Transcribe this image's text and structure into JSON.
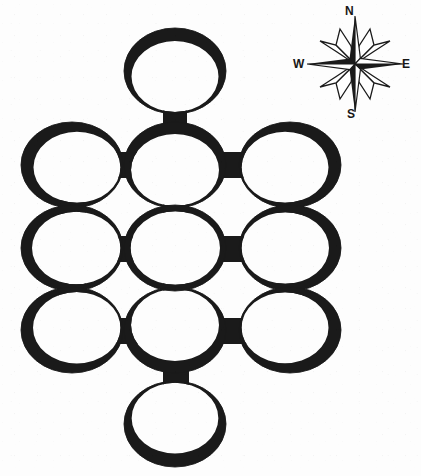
{
  "figure": {
    "kind": "map-diagram",
    "background_color": "#fdfdfd",
    "ink_color": "#1a1a1a",
    "canvas": {
      "width": 421,
      "height": 476
    }
  },
  "compass": {
    "name": "compass-rose",
    "center": {
      "x": 65,
      "y": 62
    },
    "labels": {
      "north": "N",
      "east": "E",
      "south": "S",
      "west": "W"
    },
    "points": 8,
    "style": "eight-point-star-black-and-white"
  },
  "network": {
    "ring_count": 11,
    "connector_count": 12,
    "ring_rx": 51,
    "ring_ry": 43,
    "rings": [
      {
        "id": "ring-top",
        "name": "ring-north-stem",
        "cx": 175,
        "cy": 71,
        "thick_angle_deg": 270,
        "thin": 2.0,
        "thick": 13.0
      },
      {
        "id": "ring-r1c1",
        "name": "ring-row1-col1",
        "cx": 72,
        "cy": 165,
        "thick_angle_deg": 205,
        "thin": 2.0,
        "thick": 13.0
      },
      {
        "id": "ring-r1c2",
        "name": "ring-row1-col2",
        "cx": 175,
        "cy": 165,
        "thick_angle_deg": 270,
        "thin": 2.0,
        "thick": 12.0
      },
      {
        "id": "ring-r1c3",
        "name": "ring-row1-col3",
        "cx": 290,
        "cy": 165,
        "thick_angle_deg": 335,
        "thin": 2.0,
        "thick": 13.0
      },
      {
        "id": "ring-r2c1",
        "name": "ring-row2-col1",
        "cx": 72,
        "cy": 248,
        "thick_angle_deg": 180,
        "thin": 2.5,
        "thick": 11.0
      },
      {
        "id": "ring-r2c2",
        "name": "ring-row2-col2-center",
        "cx": 175,
        "cy": 248,
        "thick_angle_deg": 180,
        "thin": 6.0,
        "thick": 6.5
      },
      {
        "id": "ring-r2c3",
        "name": "ring-row2-col3",
        "cx": 290,
        "cy": 248,
        "thick_angle_deg": 0,
        "thin": 2.5,
        "thick": 12.0
      },
      {
        "id": "ring-r3c1",
        "name": "ring-row3-col1",
        "cx": 72,
        "cy": 330,
        "thick_angle_deg": 155,
        "thin": 2.0,
        "thick": 12.5
      },
      {
        "id": "ring-r3c2",
        "name": "ring-row3-col2",
        "cx": 175,
        "cy": 330,
        "thick_angle_deg": 90,
        "thin": 2.0,
        "thick": 12.0
      },
      {
        "id": "ring-r3c3",
        "name": "ring-row3-col3",
        "cx": 290,
        "cy": 330,
        "thick_angle_deg": 25,
        "thin": 2.0,
        "thick": 13.0
      },
      {
        "id": "ring-bottom",
        "name": "ring-south-stem",
        "cx": 175,
        "cy": 424,
        "thick_angle_deg": 90,
        "thin": 1.8,
        "thick": 13.5
      }
    ],
    "connectors": [
      {
        "id": "conn-top-r1c2",
        "name": "connector-vertical-north-stem",
        "orientation": "vertical",
        "x": 163,
        "y": 108,
        "w": 24,
        "h": 18
      },
      {
        "id": "conn-r1c1-r1c2",
        "name": "connector-horizontal-r1-left",
        "orientation": "horizontal",
        "x": 115,
        "y": 152,
        "w": 48,
        "h": 26
      },
      {
        "id": "conn-r1c2-r1c3",
        "name": "connector-horizontal-r1-right",
        "orientation": "horizontal",
        "x": 219,
        "y": 152,
        "w": 53,
        "h": 26
      },
      {
        "id": "conn-r1c1-r2c1",
        "name": "connector-vertical-col1-upper",
        "orientation": "vertical",
        "x": 58,
        "y": 200,
        "w": 28,
        "h": 16
      },
      {
        "id": "conn-r1c2-r2c2",
        "name": "connector-vertical-col2-upper",
        "orientation": "vertical",
        "x": 163,
        "y": 200,
        "w": 26,
        "h": 16
      },
      {
        "id": "conn-r1c3-r2c3",
        "name": "connector-vertical-col3-upper",
        "orientation": "vertical",
        "x": 276,
        "y": 200,
        "w": 28,
        "h": 16
      },
      {
        "id": "conn-r2c1-r2c2",
        "name": "connector-horizontal-r2-left",
        "orientation": "horizontal",
        "x": 112,
        "y": 236,
        "w": 52,
        "h": 26
      },
      {
        "id": "conn-r2c2-r2c3",
        "name": "connector-horizontal-r2-right",
        "orientation": "horizontal",
        "x": 220,
        "y": 236,
        "w": 54,
        "h": 26
      },
      {
        "id": "conn-r2c1-r3c1",
        "name": "connector-vertical-col1-lower",
        "orientation": "vertical",
        "x": 58,
        "y": 283,
        "w": 28,
        "h": 16
      },
      {
        "id": "conn-r2c2-r3c2",
        "name": "connector-vertical-col2-lower",
        "orientation": "vertical",
        "x": 163,
        "y": 283,
        "w": 26,
        "h": 16
      },
      {
        "id": "conn-r2c3-r3c3",
        "name": "connector-vertical-col3-lower",
        "orientation": "vertical",
        "x": 276,
        "y": 283,
        "w": 28,
        "h": 16
      },
      {
        "id": "conn-r3c1-r3c2",
        "name": "connector-horizontal-r3-left",
        "orientation": "horizontal",
        "x": 112,
        "y": 318,
        "w": 52,
        "h": 26
      },
      {
        "id": "conn-r3c2-r3c3",
        "name": "connector-horizontal-r3-right",
        "orientation": "horizontal",
        "x": 220,
        "y": 318,
        "w": 54,
        "h": 26
      },
      {
        "id": "conn-r3c2-bottom",
        "name": "connector-vertical-south-stem",
        "orientation": "vertical",
        "x": 163,
        "y": 366,
        "w": 26,
        "h": 20
      }
    ]
  }
}
